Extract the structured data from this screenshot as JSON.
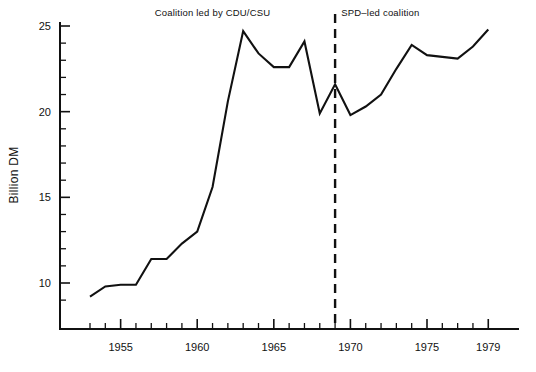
{
  "chart_data": {
    "type": "line",
    "title": "",
    "subtitle": "",
    "xlabel": "",
    "ylabel": "Billion DM",
    "xlim": [
      1953,
      1979
    ],
    "ylim": [
      8.5,
      25
    ],
    "grid": false,
    "legend_position": "none",
    "x": [
      1953,
      1954,
      1955,
      1956,
      1957,
      1958,
      1959,
      1960,
      1961,
      1962,
      1963,
      1964,
      1965,
      1966,
      1967,
      1968,
      1969,
      1970,
      1971,
      1972,
      1973,
      1974,
      1975,
      1976,
      1977,
      1978,
      1979
    ],
    "values": [
      9.2,
      9.8,
      9.9,
      9.9,
      11.4,
      11.4,
      12.3,
      13.0,
      15.6,
      20.6,
      24.7,
      23.4,
      22.6,
      22.6,
      24.1,
      19.9,
      21.6,
      19.8,
      20.3,
      21.0,
      22.5,
      23.9,
      23.3,
      23.2,
      23.1,
      23.8,
      24.8
    ],
    "series": [
      {
        "name": "Defense expenditure",
        "values": [
          9.2,
          9.8,
          9.9,
          9.9,
          11.4,
          11.4,
          12.3,
          13.0,
          15.6,
          20.6,
          24.7,
          23.4,
          22.6,
          22.6,
          24.1,
          19.9,
          21.6,
          19.8,
          20.3,
          21.0,
          22.5,
          23.9,
          23.3,
          23.2,
          23.1,
          23.8,
          24.8
        ],
        "color": "#111111"
      }
    ],
    "y_major_ticks": [
      10,
      15,
      20,
      25
    ],
    "y_major_tick_labels": [
      "10",
      "15",
      "20",
      "25"
    ],
    "y_minor_tick_step": 1,
    "x_major_ticks": [
      1955,
      1960,
      1965,
      1970,
      1975,
      1979
    ],
    "x_major_tick_labels": [
      "1955",
      "1960",
      "1965",
      "1970",
      "1975",
      "1979"
    ],
    "x_minor_tick_step": 1,
    "annotations": [
      {
        "name": "cdu-csu-era-label",
        "text": "Coalition led by CDU/CSU",
        "x": 1961.0,
        "y": 25.6,
        "align": "middle"
      },
      {
        "name": "spd-era-label",
        "text": "SPD–led coalition",
        "x": 1969.4,
        "y": 25.6,
        "align": "start"
      }
    ],
    "reference_lines": [
      {
        "name": "coalition-change-divider",
        "orientation": "vertical",
        "x": 1969,
        "style": "dashed",
        "color": "#111111"
      }
    ]
  }
}
